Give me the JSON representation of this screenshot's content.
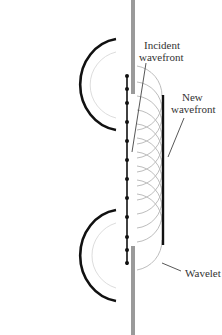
{
  "diagram": {
    "labels": {
      "incident_line1": "Incident",
      "incident_line2": "wavefront",
      "new_line1": "New",
      "new_line2": "wavefront",
      "wavelet": "Wavelet"
    },
    "colors": {
      "barrier": "#9a9a9a",
      "wavefront": "#111111",
      "wavelet": "#bdbdbd",
      "leader": "#444444",
      "text": "#333333"
    },
    "source_points_y": [
      76,
      89,
      103,
      122,
      141,
      160,
      179,
      198,
      217,
      237,
      250,
      263
    ]
  }
}
